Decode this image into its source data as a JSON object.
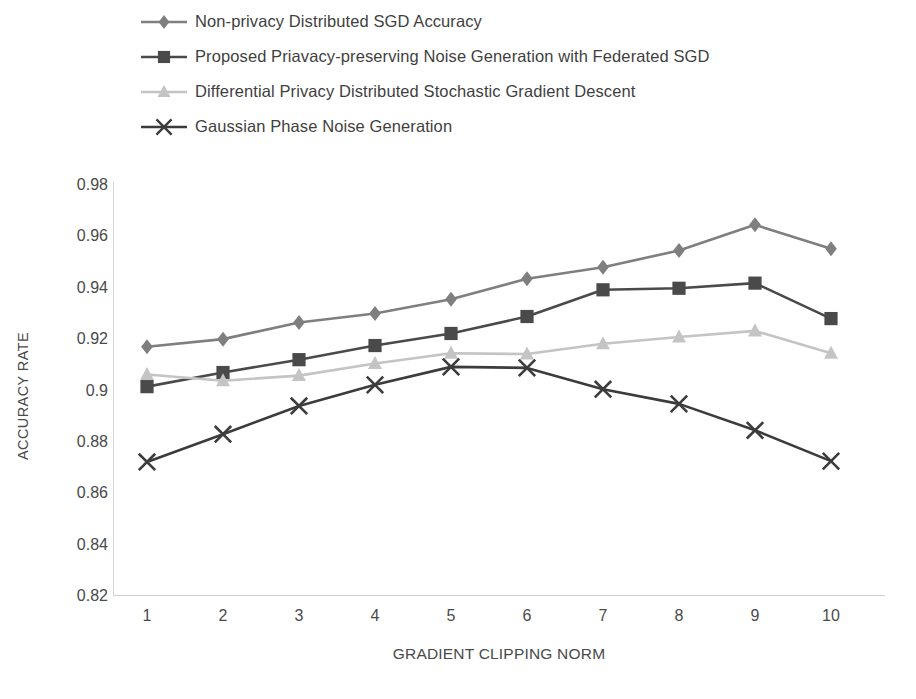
{
  "chart_data": {
    "type": "line",
    "title": "",
    "xlabel": "GRADIENT CLIPPING NORM",
    "ylabel": "ACCURACY RATE",
    "x": [
      1,
      2,
      3,
      4,
      5,
      6,
      7,
      8,
      9,
      10
    ],
    "x_tick_labels": [
      "1",
      "2",
      "3",
      "4",
      "5",
      "6",
      "7",
      "8",
      "9",
      "10"
    ],
    "y_tick_labels": [
      "0.98",
      "0.96",
      "0.94",
      "0.92",
      "0.9",
      "0.88",
      "0.86",
      "0.84",
      "0.82"
    ],
    "y_ticks": [
      0.98,
      0.96,
      0.94,
      0.92,
      0.9,
      0.88,
      0.86,
      0.84,
      0.82
    ],
    "ylim": [
      0.82,
      0.98
    ],
    "xlim": [
      1,
      10
    ],
    "grid": false,
    "legend_position": "top-left",
    "series": [
      {
        "name": "Non-privacy Distributed SGD Accuracy",
        "marker": "diamond",
        "color": "#7f7f7f",
        "values": [
          0.917,
          0.92,
          0.9265,
          0.93,
          0.9355,
          0.9435,
          0.948,
          0.9545,
          0.9645,
          0.9552
        ]
      },
      {
        "name": "Proposed Priavacy-preserving Noise Generation with Federated SGD",
        "marker": "square",
        "color": "#4a4a4a",
        "values": [
          0.9015,
          0.907,
          0.912,
          0.9175,
          0.9222,
          0.9288,
          0.9392,
          0.9398,
          0.9418,
          0.928
        ]
      },
      {
        "name": "Differential Privacy Distributed Stochastic Gradient Descent",
        "marker": "triangle",
        "color": "#c4c4c4",
        "values": [
          0.9062,
          0.9038,
          0.9058,
          0.9105,
          0.9145,
          0.9142,
          0.9182,
          0.9208,
          0.9232,
          0.9145
        ]
      },
      {
        "name": "Gaussian Phase Noise Generation",
        "marker": "x",
        "color": "#3c3c3c",
        "values": [
          0.8722,
          0.883,
          0.894,
          0.9022,
          0.9092,
          0.9088,
          0.9005,
          0.8948,
          0.8845,
          0.8725
        ]
      }
    ]
  }
}
